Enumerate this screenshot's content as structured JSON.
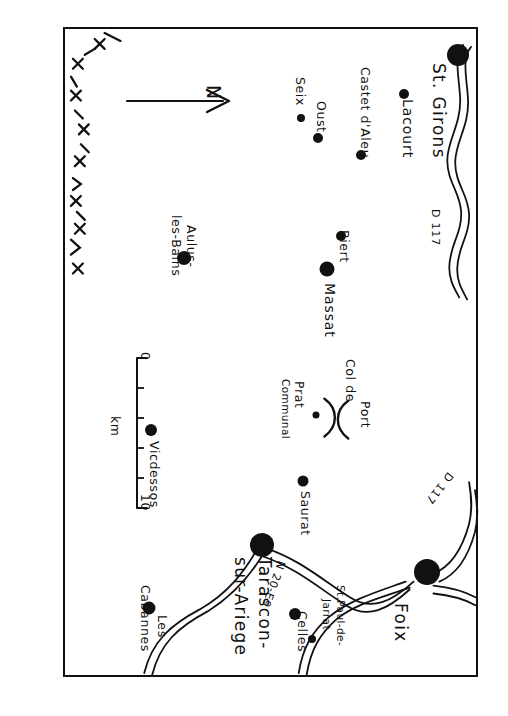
{
  "document": {
    "kind": "hand-drawn-sketch-map",
    "title": "St. Girons to Tarascon-sur-Ariege.",
    "ink_color": "#111111",
    "paper_color": "#ffffff"
  },
  "map": {
    "north_arrow": {
      "label": "N",
      "points": "right-of-page (map is rotated 90° clockwise)"
    },
    "scale": {
      "unit_label": "km",
      "min_label": "0",
      "max_label": "10",
      "ticks": 5
    },
    "frontier": {
      "name": "international-border",
      "symbol": "x-and-dash chain"
    },
    "towns": [
      {
        "name": "St. Girons",
        "label": "St. Girons",
        "size": "large",
        "x": 0.955,
        "y": 0.04
      },
      {
        "name": "Lacourt",
        "label": "Lacourt",
        "size": "small",
        "x": 0.825,
        "y": 0.1
      },
      {
        "name": "Castet d'Aleu",
        "label": "Castet d'Aleu",
        "size": "small",
        "x": 0.72,
        "y": 0.195
      },
      {
        "name": "Seix",
        "label": "Seix",
        "size": "small",
        "x": 0.575,
        "y": 0.138
      },
      {
        "name": "Oust",
        "label": "Oust",
        "size": "small",
        "x": 0.615,
        "y": 0.168
      },
      {
        "name": "Biert",
        "label": "Biert",
        "size": "small",
        "x": 0.672,
        "y": 0.32
      },
      {
        "name": "Massat",
        "label": "Massat",
        "size": "medium",
        "x": 0.638,
        "y": 0.372
      },
      {
        "name": "Aulus-les-Bains",
        "label": "Aulus-\nles-Bains",
        "size": "medium",
        "x": 0.29,
        "y": 0.355
      },
      {
        "name": "Prat Communal",
        "label": "Prat\nCommunal",
        "size": "tiny",
        "x": 0.61,
        "y": 0.598
      },
      {
        "name": "Saurat",
        "label": "Saurat",
        "size": "small",
        "x": 0.578,
        "y": 0.7
      },
      {
        "name": "Vicdessos",
        "label": "Vicdessos",
        "size": "small",
        "x": 0.21,
        "y": 0.62
      },
      {
        "name": "Tarascon-sur-Ariege",
        "label": "Tarascon-\nsur-Ariege",
        "size": "large",
        "x": 0.48,
        "y": 0.798
      },
      {
        "name": "Les Cabannes",
        "label": "Les\nCabannes",
        "size": "small",
        "x": 0.205,
        "y": 0.897
      },
      {
        "name": "Celles",
        "label": "Celles",
        "size": "small",
        "x": 0.56,
        "y": 0.905
      },
      {
        "name": "St. Paul-de-Jarrat",
        "label": "St. Paul-de-\nJarrat",
        "size": "tiny",
        "x": 0.6,
        "y": 0.945
      },
      {
        "name": "Foix",
        "label": "Foix",
        "size": "large",
        "x": 0.88,
        "y": 0.84
      }
    ],
    "roads": [
      {
        "name": "D117-north",
        "label": "D 117"
      },
      {
        "name": "N20-E9",
        "label": "N 20-E9"
      },
      {
        "name": "D117-south",
        "label": "D 117"
      }
    ],
    "passes": [
      {
        "name": "Col de Port",
        "label": "Col de\nPort",
        "symbol": ")("
      }
    ]
  },
  "labels": {
    "st_girons": "St. Girons",
    "lacourt": "Lacourt",
    "castet_daleu": "Castet d'Aleu",
    "seix": "Seix",
    "oust": "Oust",
    "biert": "Biert",
    "massat": "Massat",
    "aulus_1": "Aulus-",
    "aulus_2": "les-Bains",
    "col_de_port_1": "Col de",
    "col_de_port_2": "Port",
    "prat": "Prat",
    "communal": "Communal",
    "saurat": "Saurat",
    "vicdessos": "Vicdessos",
    "tarascon_1": "Tarascon-",
    "tarascon_2": "sur-Ariege",
    "les": "Les",
    "cabannes": "Cabannes",
    "celles": "Celles",
    "stpaul_1": "St.Paul-de-",
    "stpaul_2": "Jarrat",
    "foix": "Foix",
    "d117_north": "D 117",
    "n20e9": "N 20-E9",
    "d117_south": "D 117",
    "north": "N",
    "km": "km",
    "scale_zero": "0",
    "scale_ten": "10"
  }
}
